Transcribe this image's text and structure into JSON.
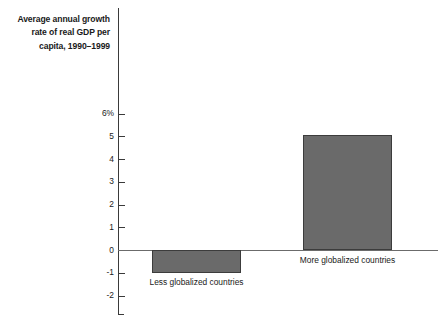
{
  "chart_data": {
    "type": "bar",
    "title": "Average annual growth rate of real GDP per capita, 1990–1999",
    "title_lines": "Average annual growth\nrate of real GDP per\ncapita, 1990–1999",
    "xlabel": "",
    "ylabel": "",
    "categories": [
      "Less globalized countries",
      "More globalized countries"
    ],
    "values": [
      -1.0,
      5.05
    ],
    "ylim": [
      -2,
      6
    ],
    "yticks": [
      6,
      5,
      4,
      3,
      2,
      1,
      0,
      -1,
      -2
    ],
    "ytick_labels": [
      "6%",
      "5",
      "4",
      "3",
      "2",
      "1",
      "0",
      "-1",
      "-2"
    ],
    "grid": false,
    "legend": "none",
    "bar_color": "#6a6a6a",
    "bar_border_color": "#3c3c3c",
    "axis_color": "#3a3a3a",
    "zero_line_color": "#6b6b6b",
    "background": "#ffffff"
  }
}
